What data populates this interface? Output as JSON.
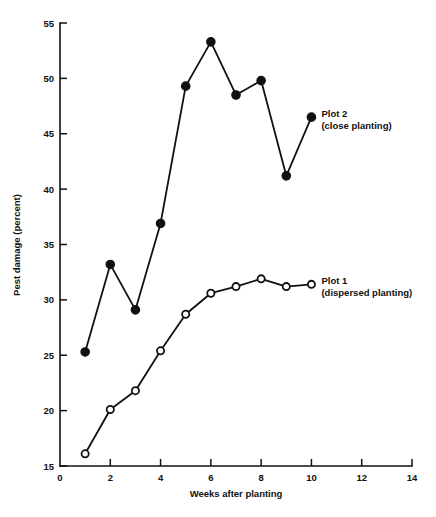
{
  "chart_data": {
    "type": "line",
    "title": "",
    "xlabel": "Weeks after planting",
    "ylabel": "Pest damage (percent)",
    "xlim": [
      0,
      14
    ],
    "ylim": [
      15,
      55
    ],
    "xticks": [
      0,
      2,
      4,
      6,
      8,
      10,
      12,
      14
    ],
    "yticks": [
      15,
      20,
      25,
      30,
      35,
      40,
      45,
      50,
      55
    ],
    "xtick_labels": [
      "0",
      "2",
      "4",
      "6",
      "8",
      "10",
      "12",
      "14"
    ],
    "ytick_labels": [
      "15",
      "20",
      "25",
      "30",
      "35",
      "40",
      "45",
      "50",
      "55"
    ],
    "grid": false,
    "legend_position": "inline-right",
    "x": [
      1,
      2,
      3,
      4,
      5,
      6,
      7,
      8,
      9,
      10
    ],
    "series": [
      {
        "name": "Plot 2",
        "label_line1": "Plot 2",
        "label_line2": "(close planting)",
        "marker": "filled-circle",
        "color": "#111111",
        "values": [
          25.3,
          33.2,
          29.1,
          36.9,
          49.3,
          53.3,
          48.5,
          49.8,
          41.2,
          46.5
        ]
      },
      {
        "name": "Plot 1",
        "label_line1": "Plot 1",
        "label_line2": "(dispersed planting)",
        "marker": "open-circle",
        "color": "#111111",
        "values": [
          16.1,
          20.1,
          21.8,
          25.4,
          28.7,
          30.6,
          31.2,
          31.9,
          31.2,
          31.4
        ]
      }
    ]
  }
}
